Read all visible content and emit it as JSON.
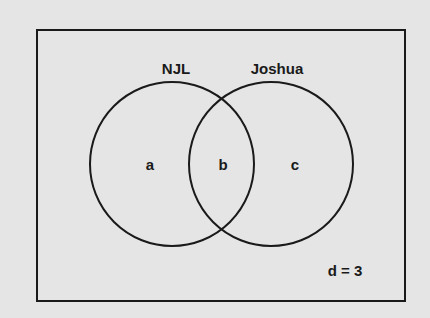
{
  "diagram": {
    "type": "venn",
    "sets": [
      {
        "name": "NJL",
        "region_label": "a"
      },
      {
        "name": "Joshua",
        "region_label": "c"
      }
    ],
    "intersection_label": "b",
    "outside_label": "d = 3",
    "colors": {
      "background": "#e5e5e5",
      "stroke": "#1a1a1a",
      "text": "#1a1a1a"
    }
  }
}
